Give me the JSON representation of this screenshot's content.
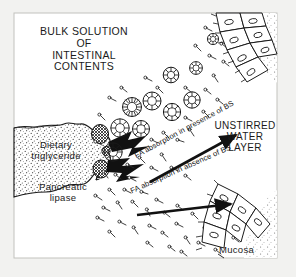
{
  "figure": {
    "domain_note": "physiology diagram of intestinal fat digestion and absorption",
    "background_color": "#f2f2f0",
    "ink_color": "#111111",
    "frame_color": "#b9b9b4",
    "labels": {
      "bulk_solution": "BULK SOLUTION\nOF\nINTESTINAL\nCONTENTS",
      "unstirred_water_layer": "UNSTIRRED\nWATER\nLAYER",
      "dietary_triglyceride": "Dietary\ntriglyceride",
      "pancreatic_lipase": "Pancreatic\nlipase",
      "mucosa": "Mucosa"
    },
    "arrows": [
      {
        "name": "fa-absorption-presence-bs",
        "label": "FA absorption in presence of BS",
        "from": [
          150,
          182
        ],
        "to": [
          240,
          133
        ],
        "angle_deg": -28.5
      },
      {
        "name": "fa-absorption-absence-bs",
        "label": "FA absorption in absence of BS",
        "from": [
          137,
          215
        ],
        "to": [
          235,
          203
        ],
        "angle_deg": -24
      }
    ],
    "structures": {
      "lipid_droplet": "stippled dietary triglyceride mass at left edge",
      "lipase_blobs": "cross-hatched pancreatic lipase enzyme clusters on droplet surface",
      "emulsion_arrows": "two solid black chevron arrows emerging from droplet",
      "micelles": "radial sunburst circles representing bile-salt mixed micelles",
      "fatty_acids": "scattered lollipop rods representing free fatty acid molecules",
      "mucosa_cells": "radially arranged columnar epithelial cells with oval nuclei, upper-right and lower-right"
    }
  }
}
